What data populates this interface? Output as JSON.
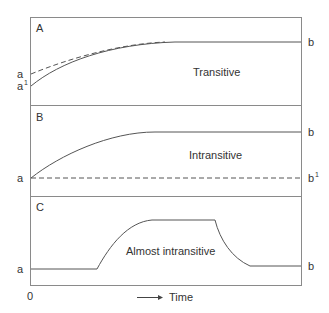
{
  "diagram": {
    "panels": [
      {
        "id": "A",
        "letter": "A",
        "description": "Transitive",
        "left_labels": {
          "dashed_start": "a",
          "solid_start": "a",
          "solid_start_sup": "1"
        },
        "right_labels": {
          "end": "b"
        }
      },
      {
        "id": "B",
        "letter": "B",
        "description": "Intransitive",
        "left_labels": {
          "start": "a"
        },
        "right_labels": {
          "solid_end": "b",
          "dashed_end": "b",
          "dashed_end_sup": "1"
        }
      },
      {
        "id": "C",
        "letter": "C",
        "description": "Almost intransitive",
        "left_labels": {
          "start": "a"
        },
        "right_labels": {
          "end": "b"
        }
      }
    ],
    "x_axis": {
      "origin_label": "0",
      "label": "Time"
    }
  }
}
